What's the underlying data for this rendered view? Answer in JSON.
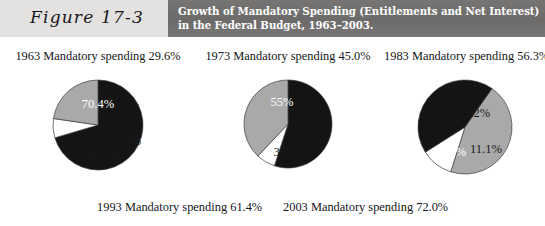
{
  "figure": {
    "label": "Figure 17-3",
    "title": "Growth of Mandatory Spending (Entitlements and Net Interest) in the Federal Budget, 1963–2003."
  },
  "colors": {
    "band_background": "#6e6d6c",
    "label_background": "#e3e2e0",
    "slice_black": "#141414",
    "slice_gray": "#a9a9a9",
    "slice_white": "#ffffff",
    "slice_outline": "#3c3c3c",
    "title_text": "#ffffff",
    "body_text": "#16161a"
  },
  "captions": {
    "top": [
      "1963 Mandatory spending 29.6%",
      "1973 Mandatory spending 45.0%",
      "1983 Mandatory spending 56.3%"
    ],
    "bottom": [
      "1993 Mandatory spending 61.4%",
      "2003 Mandatory spending 72.0%"
    ]
  },
  "chart_data": [
    {
      "type": "pie",
      "title": "1963 Mandatory spending 29.6%",
      "year": "1963",
      "mandatory_spending_pct": 29.6,
      "labels": [
        "70.4%",
        "6.9%",
        "22.7%"
      ],
      "values": [
        70.4,
        6.9,
        22.7
      ],
      "slice_colors": [
        "#141414",
        "#ffffff",
        "#a9a9a9"
      ],
      "start_angle_deg": -90,
      "legend": "none",
      "grid": false
    },
    {
      "type": "pie",
      "title": "1973 Mandatory spending 45.0%",
      "year": "1973",
      "mandatory_spending_pct": 45.0,
      "labels": [
        "55%",
        "7%",
        "38%"
      ],
      "values": [
        55,
        7,
        38
      ],
      "slice_colors": [
        "#141414",
        "#ffffff",
        "#a9a9a9"
      ],
      "start_angle_deg": -90,
      "legend": "none",
      "grid": false
    },
    {
      "type": "pie",
      "title": "1983 Mandatory spending 56.3%",
      "year": "1983",
      "mandatory_spending_pct": 56.3,
      "labels": [
        "45.2%",
        "11.1%",
        "43.7%"
      ],
      "values": [
        45.2,
        11.1,
        43.7
      ],
      "slice_colors": [
        "#a9a9a9",
        "#ffffff",
        "#141414"
      ],
      "start_angle_deg": -55,
      "legend": "none",
      "grid": false
    }
  ],
  "pies": [
    {
      "radius": 45,
      "slices": [
        {
          "label": "70.4%",
          "value": 70.4,
          "fill": "#141414",
          "text_class": "lbl-on-dark",
          "lx": 0,
          "ly": -20
        },
        {
          "label": "6.9%",
          "value": 6.9,
          "fill": "#ffffff",
          "text_class": "lbl-on-light",
          "lx": 30,
          "ly": 17
        },
        {
          "label": "22.7%",
          "value": 22.7,
          "fill": "#a9a9a9",
          "text_class": "lbl-on-light",
          "lx": 5,
          "ly": 31
        }
      ],
      "start_angle_deg": -90
    },
    {
      "radius": 44,
      "slices": [
        {
          "label": "55%",
          "value": 55,
          "fill": "#141414",
          "text_class": "lbl-on-dark",
          "lx": -6,
          "ly": -21
        },
        {
          "label": "7%",
          "value": 7,
          "fill": "#ffffff",
          "text_class": "lbl-on-light",
          "lx": 28,
          "ly": 16
        },
        {
          "label": "38%",
          "value": 38,
          "fill": "#a9a9a9",
          "text_class": "lbl-on-light",
          "lx": -3,
          "ly": 29
        }
      ],
      "start_angle_deg": -90
    },
    {
      "radius": 47,
      "slices": [
        {
          "label": "45.2%",
          "value": 45.2,
          "fill": "#a9a9a9",
          "text_class": "lbl-on-light",
          "lx": 9,
          "ly": -13
        },
        {
          "label": "11.1%",
          "value": 11.1,
          "fill": "#ffffff",
          "text_class": "lbl-on-light",
          "lx": 21,
          "ly": 23
        },
        {
          "label": "43.7%",
          "value": 43.7,
          "fill": "#141414",
          "text_class": "lbl-on-dark",
          "lx": -15,
          "ly": 26
        }
      ],
      "start_angle_deg": -55
    }
  ]
}
